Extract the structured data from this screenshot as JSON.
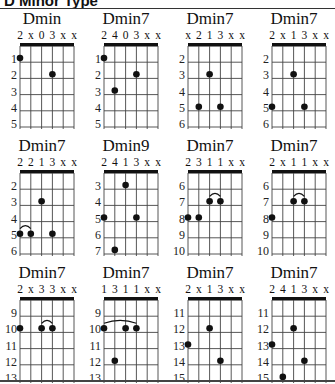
{
  "header": {
    "title": "D Minor Type"
  },
  "chart_data": {
    "type": "chord-diagrams",
    "title": "D Minor Type",
    "strings": 6,
    "chords": [
      {
        "name": "Dmin",
        "fingering": [
          "2",
          "x",
          "0",
          "3",
          "x",
          "x"
        ],
        "start_fret": 1,
        "frets": [
          1,
          2,
          3,
          4,
          5
        ],
        "dots": [
          {
            "string": 1,
            "fret": 1
          },
          {
            "string": 4,
            "fret": 2
          }
        ],
        "barres": []
      },
      {
        "name": "Dmin7",
        "fingering": [
          "2",
          "4",
          "0",
          "3",
          "x",
          "x"
        ],
        "start_fret": 1,
        "frets": [
          1,
          2,
          3,
          4,
          5
        ],
        "dots": [
          {
            "string": 1,
            "fret": 1
          },
          {
            "string": 2,
            "fret": 3
          },
          {
            "string": 4,
            "fret": 2
          }
        ],
        "barres": []
      },
      {
        "name": "Dmin7",
        "fingering": [
          "x",
          "2",
          "1",
          "3",
          "x",
          "x"
        ],
        "start_fret": 2,
        "frets": [
          2,
          3,
          4,
          5,
          6
        ],
        "dots": [
          {
            "string": 2,
            "fret": 5
          },
          {
            "string": 3,
            "fret": 3
          },
          {
            "string": 4,
            "fret": 5
          }
        ],
        "barres": []
      },
      {
        "name": "Dmin7",
        "fingering": [
          "2",
          "x",
          "1",
          "3",
          "x",
          "x"
        ],
        "start_fret": 2,
        "frets": [
          2,
          3,
          4,
          5,
          6
        ],
        "dots": [
          {
            "string": 1,
            "fret": 5
          },
          {
            "string": 3,
            "fret": 3
          },
          {
            "string": 4,
            "fret": 5
          }
        ],
        "barres": []
      },
      {
        "name": "Dmin7",
        "fingering": [
          "2",
          "2",
          "1",
          "3",
          "x",
          "x"
        ],
        "start_fret": 2,
        "frets": [
          2,
          3,
          4,
          5,
          6
        ],
        "dots": [
          {
            "string": 1,
            "fret": 5
          },
          {
            "string": 2,
            "fret": 5
          },
          {
            "string": 3,
            "fret": 3
          },
          {
            "string": 4,
            "fret": 5
          }
        ],
        "barres": [
          {
            "from": 1,
            "to": 2,
            "fret": 5
          }
        ]
      },
      {
        "name": "Dmin9",
        "fingering": [
          "2",
          "4",
          "1",
          "3",
          "x",
          "x"
        ],
        "start_fret": 3,
        "frets": [
          3,
          4,
          5,
          6,
          7
        ],
        "dots": [
          {
            "string": 1,
            "fret": 5
          },
          {
            "string": 2,
            "fret": 7
          },
          {
            "string": 3,
            "fret": 3
          },
          {
            "string": 4,
            "fret": 5
          }
        ],
        "barres": []
      },
      {
        "name": "Dmin7",
        "fingering": [
          "2",
          "3",
          "1",
          "1",
          "x",
          "x"
        ],
        "start_fret": 6,
        "frets": [
          6,
          7,
          8,
          9,
          10
        ],
        "dots": [
          {
            "string": 1,
            "fret": 8
          },
          {
            "string": 2,
            "fret": 8
          },
          {
            "string": 3,
            "fret": 7
          },
          {
            "string": 4,
            "fret": 7
          }
        ],
        "barres": [
          {
            "from": 3,
            "to": 4,
            "fret": 7
          }
        ]
      },
      {
        "name": "Dmin7",
        "fingering": [
          "2",
          "x",
          "1",
          "1",
          "x",
          "x"
        ],
        "start_fret": 6,
        "frets": [
          6,
          7,
          8,
          9,
          10
        ],
        "dots": [
          {
            "string": 1,
            "fret": 8
          },
          {
            "string": 3,
            "fret": 7
          },
          {
            "string": 4,
            "fret": 7
          }
        ],
        "barres": [
          {
            "from": 3,
            "to": 4,
            "fret": 7
          }
        ]
      },
      {
        "name": "Dmin7",
        "fingering": [
          "2",
          "x",
          "3",
          "3",
          "x",
          "x"
        ],
        "start_fret": 9,
        "frets": [
          9,
          10,
          11,
          12,
          13
        ],
        "dots": [
          {
            "string": 1,
            "fret": 10
          },
          {
            "string": 3,
            "fret": 10
          },
          {
            "string": 4,
            "fret": 10
          }
        ],
        "barres": [
          {
            "from": 3,
            "to": 4,
            "fret": 10
          }
        ]
      },
      {
        "name": "Dmin7",
        "fingering": [
          "1",
          "3",
          "1",
          "1",
          "x",
          "x"
        ],
        "start_fret": 9,
        "frets": [
          9,
          10,
          11,
          12,
          13
        ],
        "dots": [
          {
            "string": 1,
            "fret": 10
          },
          {
            "string": 2,
            "fret": 12
          },
          {
            "string": 3,
            "fret": 10
          },
          {
            "string": 4,
            "fret": 10
          }
        ],
        "barres": [
          {
            "from": 1,
            "to": 4,
            "fret": 10
          }
        ]
      },
      {
        "name": "Dmin7",
        "fingering": [
          "2",
          "x",
          "1",
          "3",
          "x",
          "x"
        ],
        "start_fret": 11,
        "frets": [
          11,
          12,
          13,
          14,
          15
        ],
        "dots": [
          {
            "string": 1,
            "fret": 13
          },
          {
            "string": 3,
            "fret": 12
          },
          {
            "string": 4,
            "fret": 14
          }
        ],
        "barres": []
      },
      {
        "name": "Dmin7",
        "fingering": [
          "2",
          "4",
          "1",
          "3",
          "x",
          "x"
        ],
        "start_fret": 11,
        "frets": [
          11,
          12,
          13,
          14,
          15
        ],
        "dots": [
          {
            "string": 1,
            "fret": 13
          },
          {
            "string": 2,
            "fret": 15
          },
          {
            "string": 3,
            "fret": 12
          },
          {
            "string": 4,
            "fret": 14
          }
        ],
        "barres": []
      }
    ]
  }
}
